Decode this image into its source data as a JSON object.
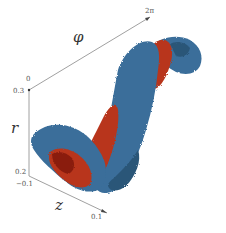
{
  "figure": {
    "axes": {
      "phi": {
        "label": "φ",
        "tick_start": "0",
        "tick_end": "2π"
      },
      "r": {
        "label": "r",
        "tick_top": "0.3",
        "tick_bottom": "0.2"
      },
      "z": {
        "label": "z",
        "tick_start": "−0.1",
        "tick_end": "0.1"
      }
    },
    "colors": {
      "outer_surface": "#3a6e9a",
      "outer_surface_dark": "#2b5678",
      "inner_surface": "#b8361a",
      "inner_surface_dark": "#8a1e10",
      "axis": "#888888"
    }
  }
}
